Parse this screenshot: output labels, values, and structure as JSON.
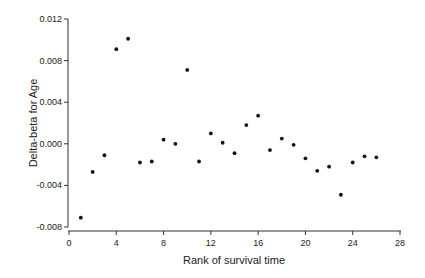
{
  "chart_data": {
    "type": "scatter",
    "title": "",
    "xlabel": "Rank of survival time",
    "ylabel": "Delta-beta for Age",
    "xlim": [
      0,
      28
    ],
    "ylim": [
      -0.008,
      0.012
    ],
    "xticks": [
      0,
      4,
      8,
      12,
      16,
      20,
      24,
      28
    ],
    "yticks": [
      -0.008,
      -0.004,
      0.0,
      0.004,
      0.008,
      0.012
    ],
    "ytick_labels": [
      "-0.008",
      "-0.004",
      "0.000",
      "0.004",
      "0.008",
      "0.012"
    ],
    "xtick_labels": [
      "0",
      "4",
      "8",
      "12",
      "16",
      "20",
      "24",
      "28"
    ],
    "grid": false,
    "legend": null,
    "marker_color": "#111111",
    "x": [
      1,
      2,
      3,
      4,
      5,
      6,
      7,
      8,
      9,
      10,
      11,
      12,
      13,
      14,
      15,
      16,
      17,
      18,
      19,
      20,
      21,
      22,
      23,
      24,
      25,
      26
    ],
    "y": [
      -0.0071,
      -0.0027,
      -0.0011,
      0.0091,
      0.0101,
      -0.0018,
      -0.0017,
      0.0004,
      0.0,
      0.0071,
      -0.0017,
      0.001,
      0.0001,
      -0.0009,
      0.0018,
      0.0027,
      -0.0006,
      0.0005,
      -0.0001,
      -0.0014,
      -0.0026,
      -0.0022,
      -0.0049,
      -0.0018,
      -0.0012,
      -0.0013
    ]
  }
}
